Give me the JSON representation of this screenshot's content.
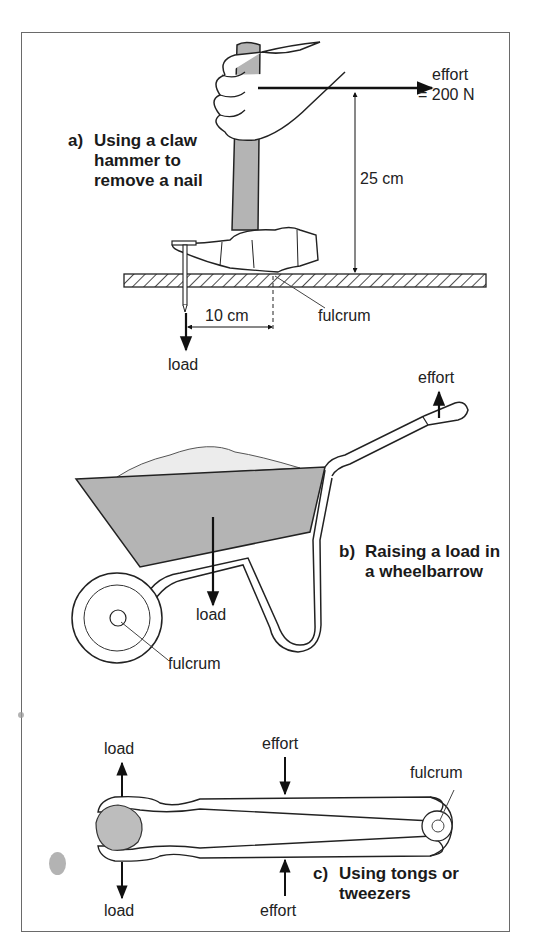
{
  "colors": {
    "ink": "#1a1a1a",
    "frame": "#6a6a6a",
    "fill_grey": "#b4b4b4",
    "load_grey": "#dcdcdc",
    "background": "#ffffff"
  },
  "panel_a": {
    "caption_tag": "a)",
    "caption_lines": [
      "Using a claw",
      "hammer to",
      "remove a nail"
    ],
    "effort_label": "effort",
    "effort_value": "= 200 N",
    "effort_distance": "25 cm",
    "load_distance": "10 cm",
    "fulcrum_label": "fulcrum",
    "load_label": "load"
  },
  "panel_b": {
    "caption_tag": "b)",
    "caption_lines": [
      "Raising a load in",
      "a wheelbarrow"
    ],
    "effort_label": "effort",
    "load_label": "load",
    "fulcrum_label": "fulcrum"
  },
  "panel_c": {
    "caption_tag": "c)",
    "caption_lines": [
      "Using tongs or",
      "tweezers"
    ],
    "load_top_label": "load",
    "load_bottom_label": "load",
    "effort_top_label": "effort",
    "effort_bottom_label": "effort",
    "fulcrum_label": "fulcrum"
  }
}
